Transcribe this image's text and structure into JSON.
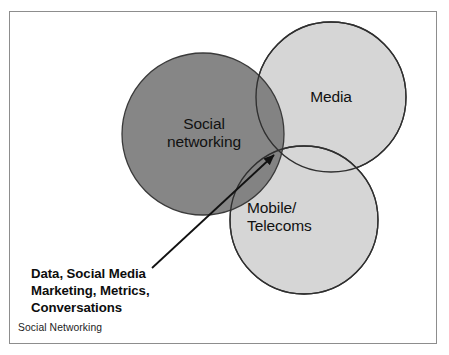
{
  "diagram": {
    "title_label": "Social Networking",
    "circles": [
      {
        "id": "social-networking",
        "label": "Social\nnetworking",
        "fill": "#7d7d7d",
        "stroke": "#3a3a3a",
        "cx": 203,
        "cy": 134,
        "r": 81
      },
      {
        "id": "media",
        "label": "Media",
        "fill": "#d6d6d6",
        "stroke": "#3a3a3a",
        "cx": 331,
        "cy": 97,
        "r": 75
      },
      {
        "id": "mobile-telecoms",
        "label": "Mobile/\nTelecoms",
        "fill": "#d6d6d6",
        "stroke": "#3a3a3a",
        "cx": 304,
        "cy": 220,
        "r": 74
      }
    ],
    "annotation": {
      "text": "Data, Social Media\nMarketing, Metrics,\nConversations",
      "arrow_from_x": 152,
      "arrow_from_y": 268,
      "arrow_to_x": 276,
      "arrow_to_y": 153,
      "arrow_color": "#111111"
    },
    "frame": {
      "border_color": "#8d8d8d",
      "background": "#ffffff"
    }
  }
}
